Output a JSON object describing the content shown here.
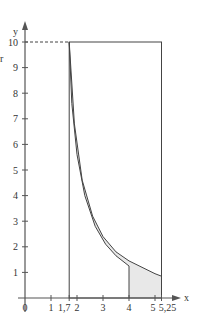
{
  "chart_data": {
    "type": "area",
    "title": "",
    "xlabel": "x",
    "ylabel": "y",
    "xlim": [
      0,
      5.5
    ],
    "ylim": [
      0,
      10.8
    ],
    "x_ticks": [
      {
        "value": 0,
        "label": "0"
      },
      {
        "value": 1,
        "label": "1"
      },
      {
        "value": 1.7,
        "label": "1,7"
      },
      {
        "value": 2,
        "label": "2"
      },
      {
        "value": 3,
        "label": "3"
      },
      {
        "value": 4,
        "label": "4"
      },
      {
        "value": 5,
        "label": "5"
      },
      {
        "value": 5.25,
        "label": "5,25"
      }
    ],
    "y_ticks": [
      {
        "value": 1,
        "label": "1"
      },
      {
        "value": 2,
        "label": "2"
      },
      {
        "value": 3,
        "label": "3"
      },
      {
        "value": 4,
        "label": "4"
      },
      {
        "value": 5,
        "label": "5"
      },
      {
        "value": 6,
        "label": "6"
      },
      {
        "value": 7,
        "label": "7"
      },
      {
        "value": 8,
        "label": "8"
      },
      {
        "value": 9,
        "label": "9"
      },
      {
        "value": 10,
        "label": "10"
      }
    ],
    "series": [
      {
        "name": "outer curve",
        "points": [
          [
            1.7,
            10
          ],
          [
            1.9,
            6.8
          ],
          [
            2.2,
            4.6
          ],
          [
            2.6,
            3.2
          ],
          [
            3.0,
            2.4
          ],
          [
            3.5,
            1.8
          ],
          [
            4.0,
            1.45
          ],
          [
            4.5,
            1.2
          ],
          [
            5.0,
            0.95
          ],
          [
            5.25,
            0.85
          ]
        ]
      },
      {
        "name": "inner curve",
        "points": [
          [
            1.7,
            10
          ],
          [
            1.8,
            7.6
          ],
          [
            2.0,
            5.6
          ],
          [
            2.3,
            4.0
          ],
          [
            2.7,
            2.8
          ],
          [
            3.1,
            2.1
          ],
          [
            3.5,
            1.65
          ],
          [
            4.0,
            1.25
          ]
        ]
      }
    ],
    "annotations": [
      {
        "type": "dashed-line",
        "from": [
          0,
          10
        ],
        "to": [
          1.7,
          10
        ]
      },
      {
        "type": "rectangle",
        "x": [
          1.7,
          5.25
        ],
        "y": [
          0,
          10
        ]
      },
      {
        "type": "vertical-line",
        "x": 4,
        "y": [
          0,
          1.25
        ]
      },
      {
        "type": "shaded-region",
        "between": [
          "inner curve",
          "outer curve"
        ],
        "color": "#e6e6e6"
      }
    ],
    "grid": false,
    "legend": "none"
  },
  "labels": {
    "side_letter": "r"
  },
  "colors": {
    "axis": "#555555",
    "curve": "#444444",
    "fill": "#e8e8e8"
  }
}
